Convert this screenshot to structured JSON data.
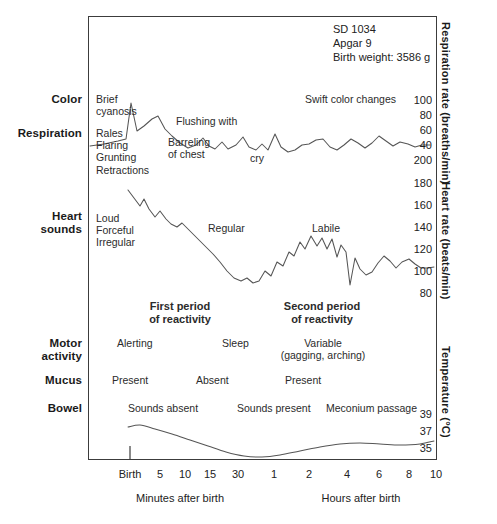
{
  "header": {
    "id_line": "SD 1034",
    "apgar_line": "Apgar 9",
    "weight_line": "Birth weight: 3586 g"
  },
  "row_labels": [
    {
      "name": "color",
      "text": "Color"
    },
    {
      "name": "respiration",
      "text": "Respiration"
    },
    {
      "name": "heart-sounds",
      "text": "Heart\nsounds"
    },
    {
      "name": "motor-activity",
      "text": "Motor\nactivity"
    },
    {
      "name": "mucus",
      "text": "Mucus"
    },
    {
      "name": "bowel",
      "text": "Bowel"
    }
  ],
  "annotations": {
    "brief_cyanosis": "Brief\ncyanosis",
    "flushing_with_cry": "Flushing with\ncry",
    "swift_color_changes": "Swift color changes",
    "rales_flaring": "Rales\nFlaring\nGrunting\nRetractions",
    "barreling_of_chest": "Barreling\nof chest",
    "loud_forceful_irregular": "Loud\nForceful\nIrregular",
    "regular": "Regular",
    "labile": "Labile",
    "first_period": "First period\nof reactivity",
    "second_period": "Second period\nof reactivity",
    "alerting": "Alerting",
    "sleep": "Sleep",
    "variable": "Variable\n(gagging, arching)",
    "mucus_present_1": "Present",
    "mucus_absent": "Absent",
    "mucus_present_2": "Present",
    "sounds_absent": "Sounds absent",
    "sounds_present": "Sounds present",
    "meconium_passage": "Meconium passage"
  },
  "axes": {
    "respiration_title": "Respiration rate (breaths/min)",
    "heart_title": "Heart rate (beats/min)",
    "temperature_title": "Temperature (°C)",
    "respiration_ticks": [
      "100",
      "80",
      "60",
      "40"
    ],
    "heart_ticks": [
      "200",
      "180",
      "160",
      "140",
      "120",
      "100",
      "80"
    ],
    "temperature_ticks": [
      "39",
      "37",
      "35"
    ],
    "x_ticks": [
      "Birth",
      "5",
      "10",
      "15",
      "30",
      "1",
      "2",
      "4",
      "6",
      "8",
      "10"
    ],
    "x_caption_left": "Minutes after birth",
    "x_caption_right": "Hours after birth"
  },
  "colors": {
    "frame": "#3c3c3c",
    "trace": "#555555",
    "text": "#1a1a1a"
  },
  "chart_data": {
    "type": "line",
    "xlabel": "Time after birth",
    "ylabel": "",
    "grid": false,
    "legend": "none",
    "x_tick_labels": [
      "Birth",
      "5",
      "10",
      "15",
      "30",
      "1",
      "2",
      "4",
      "6",
      "8",
      "10"
    ],
    "x_tick_positions_px": [
      130,
      160,
      186,
      211,
      240,
      275,
      310,
      348,
      380,
      410,
      437
    ],
    "x_caption_left": "Minutes after birth",
    "x_caption_right": "Hours after birth",
    "series": [
      {
        "name": "Respiration rate (breaths/min)",
        "ylabel": "Respiration rate (breaths/min)",
        "ytick_values": [
          100,
          80,
          60,
          40
        ],
        "ytick_y_px": [
          101,
          116,
          131,
          146
        ],
        "ylim": [
          35,
          110
        ],
        "points_px": [
          [
            90,
            146
          ],
          [
            104,
            144
          ],
          [
            118,
            141
          ],
          [
            126,
            139
          ],
          [
            131,
            103
          ],
          [
            137,
            131
          ],
          [
            144,
            126
          ],
          [
            152,
            119
          ],
          [
            158,
            116
          ],
          [
            165,
            129
          ],
          [
            172,
            136
          ],
          [
            180,
            143
          ],
          [
            188,
            148
          ],
          [
            196,
            145
          ],
          [
            203,
            138
          ],
          [
            209,
            146
          ],
          [
            215,
            149
          ],
          [
            222,
            142
          ],
          [
            228,
            149
          ],
          [
            236,
            145
          ],
          [
            243,
            137
          ],
          [
            249,
            147
          ],
          [
            256,
            150
          ],
          [
            262,
            144
          ],
          [
            268,
            150
          ],
          [
            275,
            134
          ],
          [
            281,
            147
          ],
          [
            288,
            152
          ],
          [
            295,
            150
          ],
          [
            302,
            145
          ],
          [
            309,
            144
          ],
          [
            316,
            140
          ],
          [
            323,
            139
          ],
          [
            330,
            147
          ],
          [
            337,
            150
          ],
          [
            344,
            145
          ],
          [
            351,
            139
          ],
          [
            358,
            143
          ],
          [
            365,
            148
          ],
          [
            372,
            143
          ],
          [
            379,
            136
          ],
          [
            386,
            141
          ],
          [
            393,
            146
          ],
          [
            400,
            142
          ],
          [
            408,
            144
          ],
          [
            415,
            147
          ],
          [
            422,
            145
          ],
          [
            430,
            145
          ]
        ]
      },
      {
        "name": "Heart rate (beats/min)",
        "ylabel": "Heart rate (beats/min)",
        "ytick_values": [
          200,
          180,
          160,
          140,
          120,
          100,
          80
        ],
        "ytick_y_px": [
          160,
          183,
          205,
          227,
          249,
          271,
          293
        ],
        "ylim": [
          75,
          205
        ],
        "points_px": [
          [
            128,
            190
          ],
          [
            134,
            198
          ],
          [
            140,
            206
          ],
          [
            144,
            199
          ],
          [
            149,
            209
          ],
          [
            155,
            217
          ],
          [
            160,
            211
          ],
          [
            166,
            219
          ],
          [
            171,
            224
          ],
          [
            177,
            227
          ],
          [
            182,
            223
          ],
          [
            188,
            229
          ],
          [
            194,
            235
          ],
          [
            200,
            241
          ],
          [
            207,
            248
          ],
          [
            213,
            254
          ],
          [
            220,
            262
          ],
          [
            227,
            271
          ],
          [
            234,
            278
          ],
          [
            241,
            281
          ],
          [
            247,
            278
          ],
          [
            253,
            283
          ],
          [
            259,
            281
          ],
          [
            265,
            271
          ],
          [
            271,
            276
          ],
          [
            277,
            262
          ],
          [
            283,
            266
          ],
          [
            289,
            252
          ],
          [
            294,
            256
          ],
          [
            300,
            242
          ],
          [
            305,
            249
          ],
          [
            311,
            236
          ],
          [
            317,
            246
          ],
          [
            322,
            238
          ],
          [
            327,
            249
          ],
          [
            332,
            239
          ],
          [
            337,
            257
          ],
          [
            341,
            245
          ],
          [
            346,
            252
          ],
          [
            350,
            285
          ],
          [
            355,
            258
          ],
          [
            360,
            269
          ],
          [
            366,
            275
          ],
          [
            372,
            272
          ],
          [
            378,
            263
          ],
          [
            384,
            256
          ],
          [
            390,
            261
          ],
          [
            396,
            268
          ],
          [
            402,
            262
          ],
          [
            409,
            259
          ],
          [
            415,
            264
          ],
          [
            421,
            268
          ],
          [
            428,
            268
          ],
          [
            434,
            267
          ]
        ]
      },
      {
        "name": "Temperature (°C)",
        "ylabel": "Temperature (°C)",
        "ytick_values": [
          39,
          37,
          35
        ],
        "ytick_y_px": [
          414,
          431,
          448
        ],
        "ylim": [
          34.2,
          39.5
        ],
        "points_px": [
          [
            128,
            427
          ],
          [
            140,
            425
          ],
          [
            155,
            429
          ],
          [
            172,
            434
          ],
          [
            190,
            440
          ],
          [
            208,
            446
          ],
          [
            226,
            452
          ],
          [
            244,
            456
          ],
          [
            262,
            457
          ],
          [
            280,
            455
          ],
          [
            300,
            451
          ],
          [
            320,
            447
          ],
          [
            340,
            444
          ],
          [
            360,
            443
          ],
          [
            380,
            444
          ],
          [
            400,
            445
          ],
          [
            420,
            444
          ],
          [
            434,
            441
          ]
        ]
      }
    ]
  }
}
